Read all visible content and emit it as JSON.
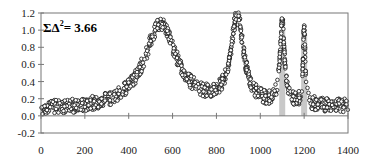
{
  "chart_data": {
    "type": "scatter",
    "title": "",
    "xlabel": "",
    "ylabel": "",
    "xlim": [
      0,
      1400
    ],
    "ylim": [
      -0.2,
      1.2
    ],
    "x_ticks": [
      "0",
      "200",
      "400",
      "600",
      "800",
      "1000",
      "1200",
      "1400"
    ],
    "y_ticks": [
      "-0.2",
      "0.0",
      "0.2",
      "0.4",
      "0.6",
      "0.8",
      "1.0",
      "1.2"
    ],
    "grid": false,
    "legend": null,
    "annotation": "ΣΔ² = 3.66",
    "annotation_parts": {
      "sigma": "ΣΔ",
      "sup": "2",
      "rest": "= 3.66"
    },
    "marker": "open-circle",
    "highlight_bars": [
      {
        "x": 1100,
        "height": 1.0,
        "color": "#c8c8c8"
      },
      {
        "x": 1200,
        "height": 0.95,
        "color": "#c8c8c8"
      }
    ],
    "peaks": [
      {
        "x": 545,
        "y": 1.08,
        "width": 90
      },
      {
        "x": 895,
        "y": 1.13,
        "width": 35
      },
      {
        "x": 1100,
        "y": 1.08,
        "width": 12
      },
      {
        "x": 1200,
        "y": 0.98,
        "width": 6
      }
    ],
    "baseline_noise": {
      "mean": 0.07,
      "amplitude": 0.08
    },
    "n_points_approx": 1400
  }
}
